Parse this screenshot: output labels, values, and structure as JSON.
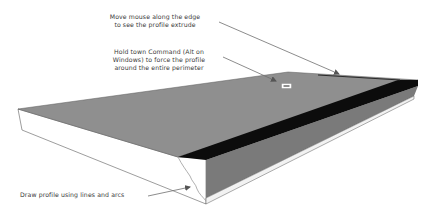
{
  "diagram": {
    "annotations": [
      {
        "id": "extrude",
        "lines": [
          "Move mouse along the edge",
          "to see the profile extrude"
        ]
      },
      {
        "id": "command",
        "lines": [
          "Hold town Command (Alt on",
          "Windows) to force the profile",
          "around the entire perimeter"
        ]
      },
      {
        "id": "profile",
        "lines": [
          "Draw profile using lines and arcs"
        ]
      }
    ],
    "cursor_icon": "follow-me-cursor-icon",
    "colors": {
      "top_face": "#8f8f8f",
      "profile_band": "#0c0c0c",
      "front_face": "#7a7a7a",
      "side_face": "#ffffff",
      "edge": "#5a5a5a",
      "leader": "#6e6e6e",
      "text": "#3a3a3a"
    }
  }
}
